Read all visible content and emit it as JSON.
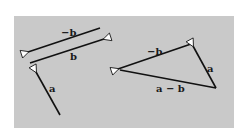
{
  "diagram": {
    "colors": {
      "background": "#c9c9c9",
      "line": "#111111",
      "arrowhead_fill": "#ffffff"
    },
    "left_group": {
      "vectors": [
        {
          "id": "neg-b",
          "label": "−b"
        },
        {
          "id": "b",
          "label": "b"
        },
        {
          "id": "a",
          "label": "a"
        }
      ]
    },
    "triangle": {
      "vectors": [
        {
          "id": "neg-b",
          "label": "−b"
        },
        {
          "id": "a",
          "label": "a"
        },
        {
          "id": "a-minus-b",
          "label": "a − b"
        }
      ]
    }
  }
}
